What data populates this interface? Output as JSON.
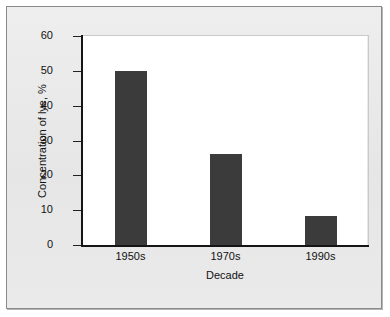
{
  "chart_data": {
    "type": "bar",
    "title": "",
    "xlabel": "Decade",
    "ylabel": "Concentration of lye, %",
    "categories": [
      "1950s",
      "1970s",
      "1990s"
    ],
    "values": [
      50,
      26,
      8.3
    ],
    "ylim": [
      0,
      60
    ],
    "yticks": [
      0,
      10,
      20,
      30,
      40,
      50,
      60
    ],
    "ytick_labels": [
      "0",
      "10",
      "20",
      "30",
      "40",
      "50",
      "60"
    ],
    "grid": false,
    "legend": null,
    "series": [
      {
        "name": "Concentration of lye",
        "values": [
          50,
          26,
          8.3
        ]
      }
    ],
    "bar_color": "#3b3b3b",
    "plot_background": "#ffffff",
    "figure_background": "#e9e9e9",
    "axis_color": "#151515"
  }
}
